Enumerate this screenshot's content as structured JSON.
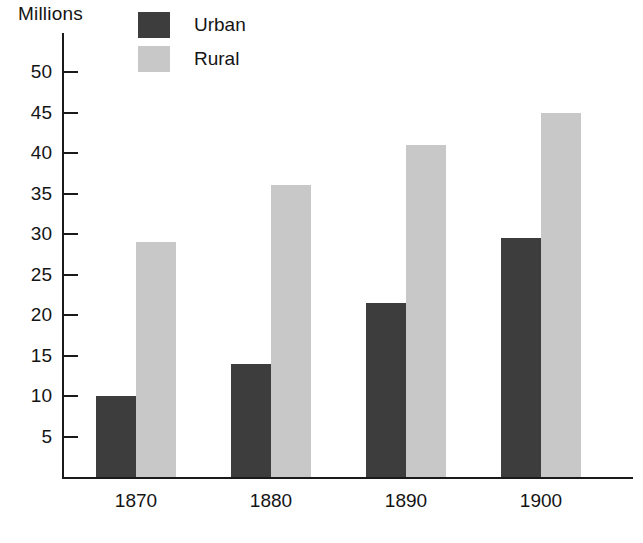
{
  "chart_data": {
    "type": "bar",
    "title": "",
    "subtitle": "",
    "xlabel": "",
    "ylabel": "Millions",
    "categories": [
      "1870",
      "1880",
      "1890",
      "1900"
    ],
    "series": [
      {
        "name": "Urban",
        "color": "#3d3d3d",
        "values": [
          10,
          14,
          21.5,
          29.5
        ]
      },
      {
        "name": "Rural",
        "color": "#c8c8c8",
        "values": [
          29,
          36,
          41,
          45
        ]
      }
    ],
    "ylim": [
      0,
      52
    ],
    "yticks": [
      5,
      10,
      15,
      20,
      25,
      30,
      35,
      40,
      45,
      50
    ],
    "ytick_labels": [
      "5",
      "10",
      "15",
      "20",
      "25",
      "30",
      "35",
      "40",
      "45",
      "50"
    ],
    "grid": false,
    "legend_position": "top-left",
    "bar_layout": "grouped-adjacent"
  },
  "axis": {
    "unit_label": "Millions"
  },
  "legend": {
    "items": [
      {
        "label": "Urban",
        "color": "#3d3d3d"
      },
      {
        "label": "Rural",
        "color": "#c8c8c8"
      }
    ]
  },
  "colors": {
    "urban": "#3d3d3d",
    "rural": "#c8c8c8",
    "axis": "#1a1a1a",
    "text": "#141414",
    "background": "#ffffff"
  }
}
